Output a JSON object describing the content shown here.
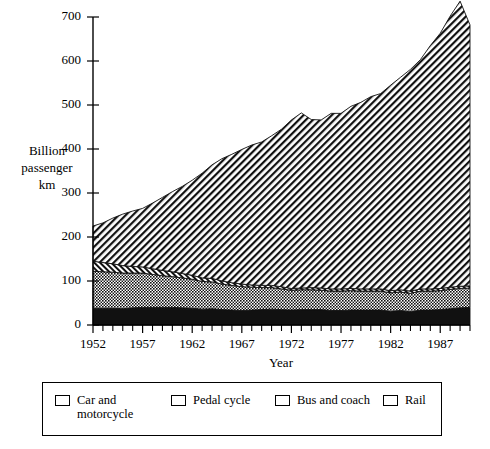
{
  "chart_data": {
    "type": "area",
    "stacked": true,
    "title": "",
    "xlabel": "Year",
    "ylabel": "Billion passenger km",
    "ylabel_lines": [
      "Billion",
      "passenger",
      "km"
    ],
    "xlim": [
      1952,
      1990
    ],
    "ylim": [
      0,
      700
    ],
    "yticks": [
      0,
      100,
      200,
      300,
      400,
      500,
      600,
      700
    ],
    "ytick_labels": [
      "0",
      "100",
      "200",
      "300",
      "400",
      "500",
      "600",
      "700"
    ],
    "xticks_major": [
      1952,
      1957,
      1962,
      1967,
      1972,
      1977,
      1982,
      1987
    ],
    "xtick_labels": [
      "1952",
      "1957",
      "1962",
      "1967",
      "1972",
      "1977",
      "1982",
      "1987"
    ],
    "xtick_minor_step": 1,
    "grid": false,
    "legend_position": "below-plot",
    "x": [
      1952,
      1953,
      1954,
      1955,
      1956,
      1957,
      1958,
      1959,
      1960,
      1961,
      1962,
      1963,
      1964,
      1965,
      1966,
      1967,
      1968,
      1969,
      1970,
      1971,
      1972,
      1973,
      1974,
      1975,
      1976,
      1977,
      1978,
      1979,
      1980,
      1981,
      1982,
      1983,
      1984,
      1985,
      1986,
      1987,
      1988,
      1989,
      1990
    ],
    "series": [
      {
        "name": "Rail",
        "pattern": "solid-black",
        "values": [
          38,
          38,
          38,
          37,
          39,
          40,
          40,
          40,
          40,
          39,
          38,
          36,
          37,
          35,
          34,
          33,
          34,
          35,
          36,
          35,
          34,
          35,
          35,
          35,
          33,
          33,
          34,
          34,
          34,
          34,
          31,
          33,
          30,
          34,
          34,
          35,
          37,
          39,
          40
        ]
      },
      {
        "name": "Bus and coach",
        "pattern": "checker-dense",
        "values": [
          84,
          83,
          82,
          81,
          79,
          78,
          75,
          72,
          70,
          68,
          66,
          63,
          61,
          58,
          56,
          54,
          52,
          50,
          49,
          47,
          45,
          45,
          45,
          44,
          44,
          44,
          44,
          43,
          43,
          43,
          42,
          42,
          42,
          43,
          43,
          43,
          44,
          44,
          44
        ]
      },
      {
        "name": "Pedal cycle",
        "pattern": "hatch-reverse-dense",
        "values": [
          23,
          21,
          19,
          17,
          15,
          14,
          13,
          12,
          11,
          10,
          9,
          8,
          8,
          7,
          6,
          6,
          5,
          5,
          5,
          5,
          4,
          4,
          5,
          5,
          5,
          5,
          5,
          5,
          5,
          5,
          5,
          5,
          5,
          5,
          5,
          5,
          5,
          5,
          5
        ]
      },
      {
        "name": "Car and motorcycle",
        "pattern": "hatch-diagonal",
        "values": [
          80,
          90,
          104,
          117,
          126,
          133,
          149,
          166,
          182,
          198,
          216,
          238,
          258,
          278,
          292,
          306,
          318,
          326,
          340,
          358,
          383,
          398,
          382,
          382,
          399,
          399,
          414,
          424,
          437,
          444,
          467,
          483,
          504,
          521,
          553,
          580,
          616,
          648,
          593
        ]
      }
    ],
    "totals": [
      225,
      232,
      243,
      252,
      259,
      265,
      277,
      290,
      303,
      315,
      329,
      345,
      364,
      378,
      388,
      399,
      409,
      416,
      430,
      445,
      466,
      482,
      467,
      466,
      481,
      481,
      497,
      506,
      519,
      526,
      545,
      563,
      581,
      603,
      635,
      663,
      702,
      736,
      682
    ]
  },
  "legend": {
    "items": [
      {
        "label": "Car and\nmotorcycle",
        "pattern": "hatch-diagonal"
      },
      {
        "label": "Pedal cycle",
        "pattern": "hatch-reverse-dense"
      },
      {
        "label": "Bus and coach",
        "pattern": "checker-dense"
      },
      {
        "label": "Rail",
        "pattern": "solid-black"
      }
    ]
  }
}
